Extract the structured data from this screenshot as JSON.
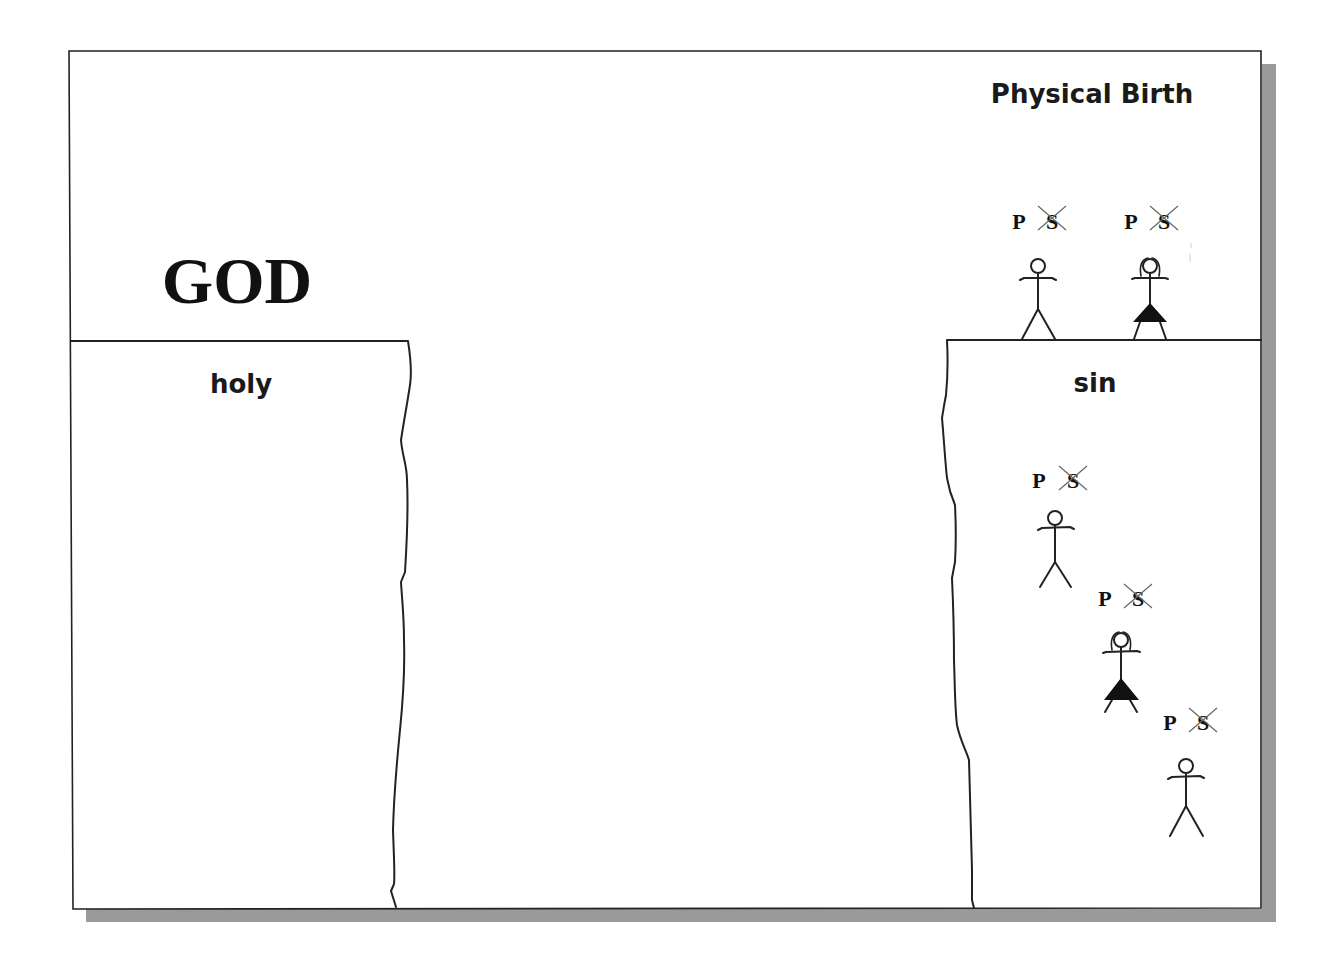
{
  "diagram": {
    "title": "Physical Birth",
    "left_heading": "GOD",
    "left_cliff_label": "holy",
    "right_cliff_label": "sin",
    "colors": {
      "frame_stroke": "#222222",
      "shadow": "#9a9a9a",
      "background": "#ffffff",
      "text": "#111111",
      "crossout": "#666666"
    },
    "figures": [
      {
        "id": "man-standing",
        "gender": "male",
        "position": "on-cliff",
        "label_p": "P",
        "label_s": "S",
        "s_crossed_out": true
      },
      {
        "id": "woman-standing",
        "gender": "female",
        "position": "on-cliff",
        "label_p": "P",
        "label_s": "S",
        "s_crossed_out": true
      },
      {
        "id": "man-falling-1",
        "gender": "male",
        "position": "falling",
        "label_p": "P",
        "label_s": "S",
        "s_crossed_out": true
      },
      {
        "id": "woman-falling",
        "gender": "female",
        "position": "falling",
        "label_p": "P",
        "label_s": "S",
        "s_crossed_out": true
      },
      {
        "id": "man-falling-2",
        "gender": "male",
        "position": "falling",
        "label_p": "P",
        "label_s": "S",
        "s_crossed_out": true
      }
    ]
  }
}
